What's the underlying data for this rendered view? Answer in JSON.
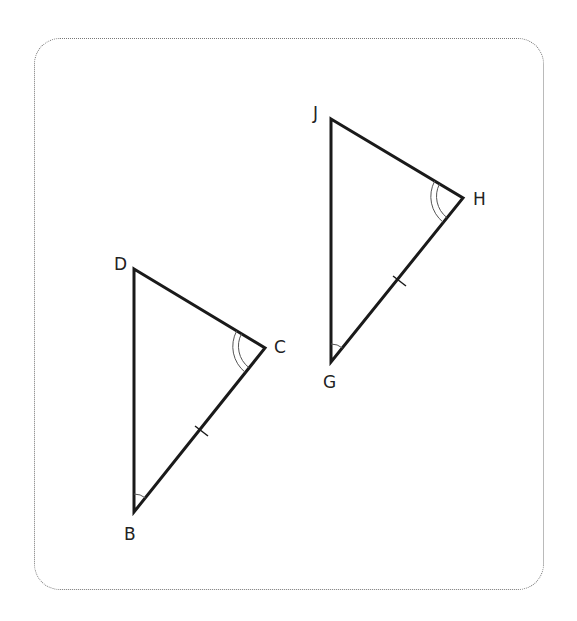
{
  "diagram": {
    "type": "congruent-triangles",
    "triangles": [
      {
        "name": "triangle-BCD",
        "vertices": {
          "D": {
            "label": "D",
            "x": 134,
            "y": 269
          },
          "C": {
            "label": "C",
            "x": 265,
            "y": 348
          },
          "B": {
            "label": "B",
            "x": 134,
            "y": 512
          }
        },
        "marks": {
          "angle_C": "double-arc",
          "angle_B": "single-arc",
          "side_BC": "single-tick"
        }
      },
      {
        "name": "triangle-GHJ",
        "vertices": {
          "J": {
            "label": "J",
            "x": 331,
            "y": 119
          },
          "H": {
            "label": "H",
            "x": 463,
            "y": 198
          },
          "G": {
            "label": "G",
            "x": 331,
            "y": 362
          }
        },
        "marks": {
          "angle_H": "double-arc",
          "angle_G": "single-arc",
          "side_GH": "single-tick"
        }
      }
    ],
    "colors": {
      "stroke": "#1a1a1a",
      "frame": "#777777"
    }
  }
}
